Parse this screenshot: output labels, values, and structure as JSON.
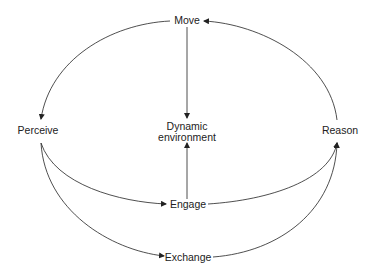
{
  "diagram": {
    "type": "cycle-flow",
    "nodes": {
      "move": "Move",
      "perceive": "Perceive",
      "reason": "Reason",
      "dynamic_line1": "Dynamic",
      "dynamic_line2": "environment",
      "engage": "Engage",
      "exchange": "Exchange"
    },
    "edges": [
      {
        "from": "Reason",
        "to": "Move"
      },
      {
        "from": "Move",
        "to": "Perceive"
      },
      {
        "from": "Move",
        "to": "Dynamic environment"
      },
      {
        "from": "Perceive",
        "to": "Engage"
      },
      {
        "from": "Perceive",
        "to": "Exchange"
      },
      {
        "from": "Engage",
        "to": "Dynamic environment"
      },
      {
        "from": "Engage",
        "to": "Reason"
      },
      {
        "from": "Exchange",
        "to": "Reason"
      }
    ],
    "colors": {
      "line": "#222222",
      "background": "#ffffff"
    }
  }
}
